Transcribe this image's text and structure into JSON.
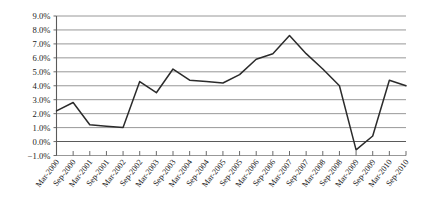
{
  "chart_data": {
    "type": "line",
    "title": "",
    "subtitle": "",
    "xlabel": "",
    "ylabel": "",
    "grid": true,
    "legend": "none",
    "ylim": [
      -1.0,
      9.0
    ],
    "ytick_step": 1.0,
    "ytick_labels": [
      "9.0%",
      "8.0%",
      "7.0%",
      "6.0%",
      "5.0%",
      "4.0%",
      "3.0%",
      "2.0%",
      "1.0%",
      "0.0%",
      "−1.0%"
    ],
    "ytick_values": [
      9.0,
      8.0,
      7.0,
      6.0,
      5.0,
      4.0,
      3.0,
      2.0,
      1.0,
      0.0,
      -1.0
    ],
    "categories": [
      "Mar-2000",
      "Sep-2000",
      "Mar-2001",
      "Sep-2001",
      "Mar-2002",
      "Sep-2002",
      "Mar-2003",
      "Sep-2003",
      "Mar-2004",
      "Sep-2004",
      "Mar-2005",
      "Sep-2005",
      "Mar-2006",
      "Sep-2006",
      "Mar-2007",
      "Sep-2007",
      "Mar-2008",
      "Sep-2008",
      "Mar-2009",
      "Sep-2009",
      "Mar-2010",
      "Sep-2010"
    ],
    "series": [
      {
        "name": "",
        "values": [
          2.2,
          2.8,
          1.2,
          1.1,
          1.0,
          4.3,
          3.5,
          5.2,
          4.4,
          4.3,
          4.2,
          4.8,
          5.9,
          6.3,
          7.6,
          6.3,
          5.2,
          4.0,
          -0.6,
          0.4,
          4.4,
          4.0
        ]
      }
    ]
  }
}
